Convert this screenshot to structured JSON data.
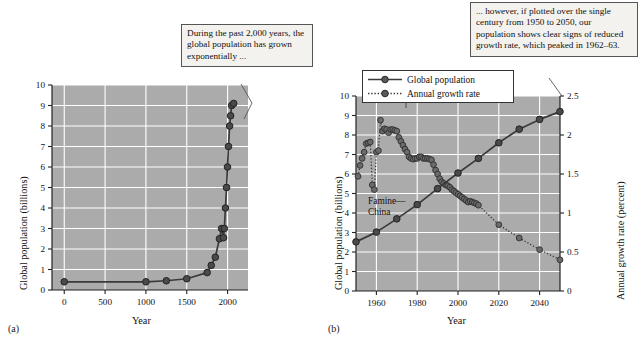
{
  "figure": {
    "panel_a_label": "(a)",
    "panel_b_label": "(b)",
    "plot_bg_color": "#ababab",
    "grid_color": "#ffffff",
    "series_color": "#3a3a3a",
    "callout_bg_color": "#f4f2ee",
    "callout_border_color": "#555555"
  },
  "callouts": {
    "a": "During the past 2,000 years, the global population has grown exponentially ...",
    "b": "... however, if plotted over the single century from 1950 to 2050, our population shows clear signs of reduced growth rate, which peaked in 1962–63."
  },
  "annotations": {
    "famine_line1": "Famine—",
    "famine_line2": "China"
  },
  "legend": {
    "items": [
      {
        "label": "Global population",
        "style": "solid-line-marker"
      },
      {
        "label": "Annual growth rate",
        "style": "dotted-line-marker"
      }
    ]
  },
  "chart_data": [
    {
      "id": "panel-a",
      "type": "line",
      "title": "",
      "xlabel": "Year",
      "ylabel": "Global population (billions)",
      "xlim": [
        -150,
        2250
      ],
      "ylim": [
        0,
        10
      ],
      "xticks": [
        0,
        500,
        1000,
        1500,
        2000
      ],
      "xtick_labels": [
        "0",
        "500",
        "1000",
        "1500",
        "2000"
      ],
      "yticks": [
        0,
        1,
        2,
        3,
        4,
        5,
        6,
        7,
        8,
        9,
        10
      ],
      "ytick_labels": [
        "0",
        "1",
        "2",
        "3",
        "4",
        "5",
        "6",
        "7",
        "8",
        "9",
        "10"
      ],
      "grid": true,
      "legend_position": "none",
      "series": [
        {
          "name": "Global population",
          "x": [
            0,
            1000,
            1250,
            1500,
            1750,
            1800,
            1850,
            1900,
            1927,
            1950,
            1960,
            1974,
            1987,
            1999,
            2011,
            2025,
            2037,
            2050,
            2075
          ],
          "y": [
            0.4,
            0.4,
            0.45,
            0.55,
            0.85,
            1.2,
            1.6,
            2.5,
            3.0,
            2.55,
            3.0,
            4.0,
            5.0,
            6.0,
            7.0,
            8.0,
            8.5,
            9.0,
            9.1
          ]
        }
      ]
    },
    {
      "id": "panel-b",
      "type": "line",
      "title": "",
      "xlabel": "Year",
      "ylabel": "Global population (billions)",
      "y2label": "Annual growth rate (percent)",
      "xlim": [
        1950,
        2050
      ],
      "ylim": [
        0,
        10
      ],
      "y2lim": [
        0,
        2.5
      ],
      "xticks": [
        1960,
        1980,
        2000,
        2020,
        2040
      ],
      "xtick_labels": [
        "1960",
        "1980",
        "2000",
        "2020",
        "2040"
      ],
      "yticks": [
        0,
        1,
        2,
        3,
        4,
        5,
        6,
        7,
        8,
        9,
        10
      ],
      "ytick_labels": [
        "0",
        "1",
        "2",
        "3",
        "4",
        "5",
        "6",
        "7",
        "8",
        "9",
        "10"
      ],
      "y2ticks": [
        0,
        0.5,
        1,
        1.5,
        2,
        2.5
      ],
      "y2tick_labels": [
        "0",
        "0.5",
        "1",
        "1.5",
        "2",
        "2.5"
      ],
      "grid": true,
      "legend_position": "upper-left",
      "series": [
        {
          "name": "Global population",
          "axis": "left",
          "x": [
            1950,
            1960,
            1970,
            1980,
            1990,
            2000,
            2010,
            2020,
            2030,
            2040,
            2050
          ],
          "y": [
            2.52,
            3.02,
            3.7,
            4.43,
            5.25,
            6.05,
            6.8,
            7.6,
            8.3,
            8.8,
            9.2
          ]
        },
        {
          "name": "Annual growth rate",
          "axis": "right",
          "x": [
            1951,
            1952,
            1953,
            1954,
            1955,
            1956,
            1957,
            1958,
            1959,
            1960,
            1961,
            1962,
            1963,
            1964,
            1965,
            1966,
            1967,
            1968,
            1969,
            1970,
            1971,
            1972,
            1973,
            1974,
            1975,
            1976,
            1977,
            1978,
            1979,
            1980,
            1981,
            1982,
            1983,
            1984,
            1985,
            1986,
            1987,
            1988,
            1989,
            1990,
            1991,
            1992,
            1993,
            1994,
            1995,
            1996,
            1997,
            1998,
            1999,
            2000,
            2001,
            2002,
            2003,
            2004,
            2005,
            2006,
            2007,
            2008,
            2009,
            2010,
            2020,
            2030,
            2040,
            2050
          ],
          "y": [
            1.47,
            1.61,
            1.7,
            1.78,
            1.89,
            1.9,
            1.91,
            1.36,
            1.3,
            1.78,
            1.8,
            2.19,
            2.05,
            2.08,
            2.07,
            2.03,
            2.07,
            2.07,
            2.06,
            2.05,
            1.97,
            1.92,
            1.87,
            1.82,
            1.78,
            1.72,
            1.7,
            1.69,
            1.7,
            1.7,
            1.72,
            1.72,
            1.7,
            1.7,
            1.7,
            1.69,
            1.68,
            1.62,
            1.55,
            1.5,
            1.44,
            1.4,
            1.38,
            1.36,
            1.35,
            1.33,
            1.3,
            1.28,
            1.26,
            1.24,
            1.22,
            1.2,
            1.18,
            1.16,
            1.14,
            1.15,
            1.14,
            1.13,
            1.12,
            1.1,
            0.85,
            0.68,
            0.53,
            0.4
          ]
        }
      ],
      "annotations": [
        {
          "text": "Famine—China",
          "x": 1960,
          "y2": 1.35
        }
      ]
    }
  ]
}
